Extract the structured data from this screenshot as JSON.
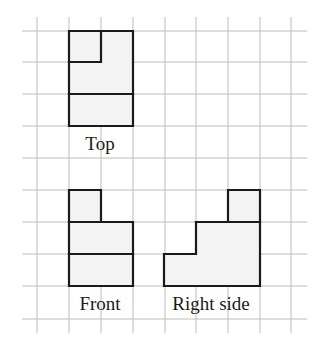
{
  "diagram": {
    "grid": {
      "x_lines": [
        37,
        69,
        101,
        133,
        165,
        196,
        228,
        260,
        291
      ],
      "y_lines": [
        31,
        62,
        94,
        126,
        158,
        190,
        222,
        254,
        286,
        319
      ],
      "x_start": 22,
      "x_end": 307,
      "y_start": 17,
      "y_end": 333,
      "color": "#bcbcbc"
    },
    "fill_color": "#f3f3f3",
    "outline_color": "#1a1a1a",
    "views": [
      {
        "name": "top",
        "label": "Top",
        "label_x": 100,
        "label_y": 150,
        "outline": "M69,31 L133,31 L133,126 L69,126 Z",
        "inner_lines": "M101,31 L101,62 L69,62 M69,94 L133,94",
        "fill": "M69,31 L133,31 L133,126 L69,126 Z"
      },
      {
        "name": "front",
        "label": "Front",
        "label_x": 100,
        "label_y": 310,
        "outline": "M69,190 L101,190 L101,222 L133,222 L133,286 L69,286 Z",
        "inner_lines": "M69,222 L101,222 M69,254 L133,254",
        "fill": "M69,190 L101,190 L101,222 L133,222 L133,286 L69,286 Z"
      },
      {
        "name": "right-side",
        "label": "Right side",
        "label_x": 211,
        "label_y": 310,
        "outline": "M228,190 L260,190 L260,286 L164,286 L164,254 L196,254 L196,222 L228,222 Z",
        "inner_lines": "M196,222 L260,222",
        "fill": "M228,190 L260,190 L260,286 L164,286 L164,254 L196,254 L196,222 L228,222 Z"
      }
    ]
  }
}
